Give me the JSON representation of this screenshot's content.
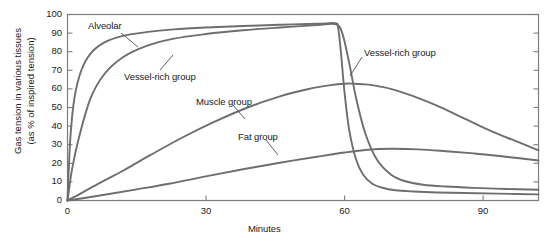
{
  "chart_data": {
    "type": "line",
    "title": "",
    "xlabel": "Minutes",
    "ylabel_line1": "Gas tension in various tissues",
    "ylabel_line2": "(as % of inspired tension)",
    "xlim": [
      0,
      102
    ],
    "ylim": [
      0,
      100
    ],
    "grid": false,
    "legend_position": "inline-annotations",
    "xticks": [
      0,
      30,
      60,
      90
    ],
    "xtick_labels": [
      "0",
      "30",
      "60",
      "90"
    ],
    "yticks": [
      0,
      10,
      20,
      30,
      40,
      50,
      60,
      70,
      80,
      90,
      100
    ],
    "ytick_labels": [
      "0",
      "10",
      "20",
      "30",
      "40",
      "50",
      "60",
      "70",
      "80",
      "90",
      "100"
    ],
    "line_color": "#6e6e6e",
    "axis_color": "#7d7d7d",
    "series": [
      {
        "name": "Alveolar",
        "x": [
          0,
          0.6,
          1.5,
          3,
          5,
          8,
          12,
          17,
          23,
          30,
          38,
          46,
          54,
          58,
          58.6,
          59.2,
          60,
          61,
          62.5,
          64,
          66,
          68,
          71,
          75,
          80,
          86,
          93,
          102
        ],
        "values": [
          0,
          33,
          55,
          70,
          79,
          85,
          88.5,
          90.5,
          92,
          93,
          93.8,
          94.5,
          95,
          95.3,
          93,
          80,
          58,
          38,
          22,
          14,
          9,
          7,
          5.5,
          4.8,
          4.3,
          4,
          3.7,
          3.3
        ]
      },
      {
        "name": "Vessel-rich group",
        "x": [
          0,
          1,
          2.5,
          5,
          8,
          12,
          17,
          23,
          30,
          38,
          46,
          54,
          58,
          59.5,
          61,
          62.5,
          64.5,
          67,
          70,
          73,
          77,
          82,
          88,
          95,
          102
        ],
        "values": [
          0,
          17,
          34,
          55,
          68,
          77,
          83,
          87,
          89.5,
          91.5,
          93,
          94.3,
          94.8,
          90,
          74,
          55,
          36,
          22,
          14,
          10.5,
          8.5,
          7.5,
          6.8,
          6.2,
          5.8
        ]
      },
      {
        "name": "Muscle group",
        "x": [
          0,
          3,
          7,
          12,
          18,
          25,
          32,
          39,
          46,
          52,
          57,
          60,
          62,
          64,
          66,
          70,
          75,
          80,
          86,
          92,
          97,
          102
        ],
        "values": [
          0,
          4,
          9.5,
          16,
          24.5,
          34,
          42.5,
          50,
          56,
          59.8,
          62,
          62.8,
          62.8,
          62.5,
          62,
          60,
          56,
          51,
          44,
          37,
          32,
          27
        ]
      },
      {
        "name": "Fat group",
        "x": [
          0,
          4,
          9,
          15,
          22,
          30,
          38,
          46,
          54,
          60,
          65,
          70,
          76,
          82,
          88,
          94,
          102
        ],
        "values": [
          0,
          1.5,
          3.5,
          6,
          9,
          13,
          16.8,
          20.3,
          23.5,
          25.8,
          27.3,
          27.8,
          27.5,
          26.5,
          25.3,
          23.8,
          21.5
        ]
      }
    ],
    "annotations": [
      {
        "id": "alveolar",
        "text": "Alveolar",
        "label_x_px": 88,
        "label_y_px": 20,
        "leader_from": [
          121,
          33
        ],
        "leader_to": [
          138,
          47
        ]
      },
      {
        "id": "vessel-rich-left",
        "text": "Vessel-rich group",
        "label_x_px": 124,
        "label_y_px": 71,
        "leader_from": [
          160,
          70
        ],
        "leader_to": [
          173,
          55
        ]
      },
      {
        "id": "muscle",
        "text": "Muscle group",
        "label_x_px": 196,
        "label_y_px": 96,
        "leader_from": [
          233,
          105
        ],
        "leader_to": [
          245,
          119
        ]
      },
      {
        "id": "fat",
        "text": "Fat group",
        "label_x_px": 238,
        "label_y_px": 131,
        "leader_from": [
          266,
          140
        ],
        "leader_to": [
          278,
          155
        ]
      },
      {
        "id": "vessel-rich-right",
        "text": "Vessel-rich group",
        "label_x_px": 364,
        "label_y_px": 47,
        "leader_from": [
          362,
          57
        ],
        "leader_to": [
          350,
          76
        ]
      }
    ]
  }
}
